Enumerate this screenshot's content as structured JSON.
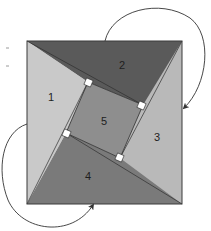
{
  "diagram": {
    "type": "geometric-dissection-proof",
    "labels": {
      "triangle_1": "1",
      "triangle_2": "2",
      "triangle_3": "3",
      "triangle_4": "4",
      "inner_square": "5"
    },
    "colors": {
      "triangle_1": "#c4c4c4",
      "triangle_2": "#5a5a5a",
      "triangle_3": "#b9b9b9",
      "triangle_4": "#7a7a7a",
      "inner_square": "#8e8e8e",
      "outline": "#3a3a3a",
      "right_angle_marker": "#ffffff",
      "arrow": "#333333",
      "background": "#ffffff"
    },
    "arrows": [
      {
        "name": "rotation-arrow-top-right",
        "from": "triangle 2 top edge",
        "to": "right side of outer square"
      },
      {
        "name": "rotation-arrow-bottom-left",
        "from": "left side of outer square",
        "to": "bottom edge of outer square"
      }
    ]
  }
}
